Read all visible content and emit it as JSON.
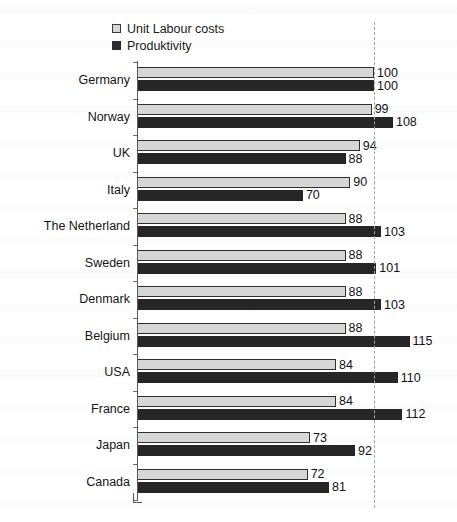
{
  "chart_data": {
    "type": "bar",
    "orientation": "horizontal",
    "title": "",
    "subtitle": "",
    "xlabel": "",
    "ylabel": "",
    "xlim": [
      0,
      120
    ],
    "grid": false,
    "reference_line": {
      "value": 100,
      "style": "dashed",
      "label": ""
    },
    "legend_position": "top-left",
    "categories": [
      "Germany",
      "Norway",
      "UK",
      "Italy",
      "The Netherland",
      "Sweden",
      "Denmark",
      "Belgium",
      "USA",
      "France",
      "Japan",
      "Canada"
    ],
    "series": [
      {
        "name": "Unit Labour costs",
        "color": "#d6d6d6",
        "values": [
          100,
          99,
          94,
          90,
          88,
          88,
          88,
          88,
          84,
          84,
          73,
          72
        ]
      },
      {
        "name": "Produktivity",
        "color": "#262626",
        "values": [
          100,
          108,
          88,
          70,
          103,
          101,
          103,
          115,
          110,
          112,
          92,
          81
        ]
      }
    ]
  },
  "legend": {
    "items": [
      {
        "label": "Unit Labour costs",
        "swatch": "light"
      },
      {
        "label": "Produktivity",
        "swatch": "dark"
      }
    ]
  }
}
